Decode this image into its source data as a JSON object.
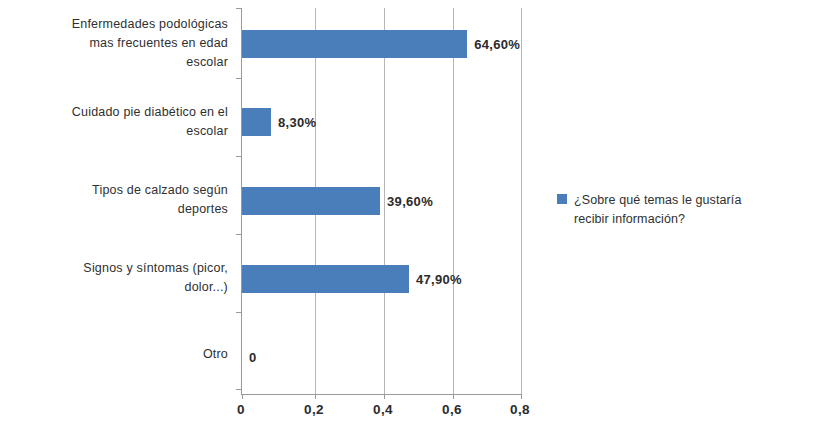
{
  "chart_data": {
    "type": "bar",
    "orientation": "horizontal",
    "title": "",
    "xlabel": "",
    "ylabel": "",
    "xlim": [
      0,
      0.8
    ],
    "xticks": [
      "0",
      "0,2",
      "0,4",
      "0,6",
      "0,8"
    ],
    "xtick_values": [
      0,
      0.2,
      0.4,
      0.6,
      0.8
    ],
    "grid": true,
    "legend_position": "right",
    "series": [
      {
        "name": "¿Sobre qué temas le gustaría recibir información?",
        "color": "#4a7ebb",
        "values": [
          0.646,
          0.083,
          0.396,
          0.479,
          0
        ],
        "labels": [
          "64,60%",
          "8,30%",
          "39,60%",
          "47,90%",
          "0"
        ]
      }
    ],
    "categories": [
      "Enfermedades podológicas mas frecuentes en edad escolar",
      "Cuidado pie diabético en el escolar",
      "Tipos de calzado según deportes",
      "Signos y síntomas (picor, dolor...)",
      "Otro"
    ],
    "category_lines": [
      [
        "Enfermedades podológicas",
        "mas frecuentes en edad",
        "escolar"
      ],
      [
        "Cuidado pie diabético en el",
        "escolar"
      ],
      [
        "Tipos de calzado según",
        "deportes"
      ],
      [
        "Signos y síntomas (picor,",
        "dolor...)"
      ],
      [
        "Otro"
      ]
    ]
  },
  "legend": {
    "entries": [
      {
        "label": "¿Sobre qué temas le gustaría recibir información?",
        "line1": "¿Sobre qué temas le gustaría",
        "line2": "recibir información?",
        "color": "#4a7ebb"
      }
    ]
  }
}
